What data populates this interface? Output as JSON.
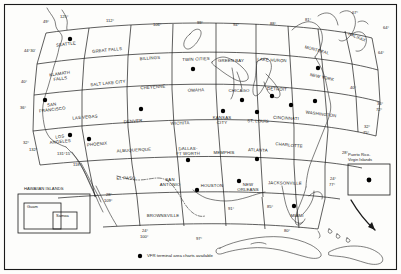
{
  "chart": {
    "type": "map",
    "border_color": "#1a1a1a",
    "line_color": "#1a1a1a",
    "dot_color": "#000000",
    "background": "#fdfdfb"
  },
  "legend": {
    "marker": "filled-circle",
    "text": "VFR terminal area charts available"
  },
  "insets": [
    {
      "name": "hawaiian-islands",
      "title": "HAWAIIAN ISLANDS",
      "sub_boxes": [
        {
          "label": "Guam"
        },
        {
          "label": "Samoa"
        }
      ]
    },
    {
      "name": "puerto-rico",
      "title": "Puerto Rico-\nVirgin Islands",
      "title_line1": "Puerto Rico-",
      "title_line2": "Virgin Islands",
      "has_dot": true
    }
  ],
  "charts": [
    {
      "label": "SEATTLE",
      "x": 66,
      "y": 44,
      "rot": -7,
      "dot": [
        70,
        39
      ]
    },
    {
      "label": "GREAT FALLS",
      "x": 107,
      "y": 50,
      "rot": -6,
      "dot": null
    },
    {
      "label": "BILLINGS",
      "x": 150,
      "y": 58,
      "rot": -4,
      "dot": null
    },
    {
      "label": "TWIN CITIES",
      "x": 196,
      "y": 59,
      "rot": -2,
      "dot": [
        193,
        69
      ]
    },
    {
      "label": "GREEN BAY",
      "x": 231,
      "y": 60,
      "rot": 0,
      "dot": null
    },
    {
      "label": "LAKE HURON",
      "x": 272,
      "y": 60,
      "rot": 3,
      "dot": null
    },
    {
      "label": "MONTREAL",
      "x": 317,
      "y": 50,
      "rot": 15,
      "dot": null
    },
    {
      "label": "HALIFAX",
      "x": 357,
      "y": 37,
      "rot": 22,
      "dot": null
    },
    {
      "label": "KLAMATH FALLS",
      "x": 60,
      "y": 76,
      "rot": -8,
      "dot": null
    },
    {
      "label": "SALT LAKE CITY",
      "x": 108,
      "y": 83,
      "rot": -6,
      "dot": null
    },
    {
      "label": "CHEYENNE",
      "x": 153,
      "y": 87,
      "rot": -4,
      "dot": null
    },
    {
      "label": "OMAHA",
      "x": 196,
      "y": 90,
      "rot": -2,
      "dot": null
    },
    {
      "label": "CHICAGO",
      "x": 239,
      "y": 90,
      "rot": 0,
      "dot": [
        242,
        100
      ]
    },
    {
      "label": "DETROIT",
      "x": 277,
      "y": 89,
      "rot": 3,
      "dot": [
        272,
        96
      ]
    },
    {
      "label": "NEW YORK",
      "x": 322,
      "y": 77,
      "rot": 12,
      "dot": [
        318,
        68
      ]
    },
    {
      "label": "SAN FRANCISCO",
      "x": 52,
      "y": 107,
      "rot": -7,
      "dot": [
        45,
        100
      ]
    },
    {
      "label": "LAS VEGAS",
      "x": 85,
      "y": 117,
      "rot": -5,
      "dot": null
    },
    {
      "label": "DENVER",
      "x": 133,
      "y": 121,
      "rot": -4,
      "dot": [
        141,
        109
      ]
    },
    {
      "label": "WICHITA",
      "x": 180,
      "y": 123,
      "rot": -2,
      "dot": null
    },
    {
      "label": "KANSAS CITY",
      "x": 222,
      "y": 120,
      "rot": 0,
      "dot": [
        223,
        111
      ]
    },
    {
      "label": "ST. LOUIS",
      "x": 258,
      "y": 121,
      "rot": 1,
      "dot": [
        257,
        112
      ]
    },
    {
      "label": "CINCINNATI",
      "x": 286,
      "y": 118,
      "rot": 3,
      "dot": [
        291,
        105
      ]
    },
    {
      "label": "WASHINGTON",
      "x": 321,
      "y": 114,
      "rot": 7,
      "dot": [
        315,
        101
      ]
    },
    {
      "label": "LOS ANGELES",
      "x": 60,
      "y": 139,
      "rot": -6,
      "dot": [
        70,
        135
      ]
    },
    {
      "label": "PHOENIX",
      "x": 97,
      "y": 144,
      "rot": -5,
      "dot": [
        89,
        139
      ]
    },
    {
      "label": "ALBUQUERQUE",
      "x": 134,
      "y": 150,
      "rot": -3,
      "dot": null
    },
    {
      "label": "DALLAS-FT WORTH",
      "x": 188,
      "y": 151,
      "rot": -1,
      "dot": [
        188,
        160
      ]
    },
    {
      "label": "MEMPHIS",
      "x": 224,
      "y": 152,
      "rot": 0,
      "dot": null
    },
    {
      "label": "ATLANTA",
      "x": 258,
      "y": 150,
      "rot": 2,
      "dot": [
        257,
        159
      ]
    },
    {
      "label": "CHARLOTTE",
      "x": 289,
      "y": 145,
      "rot": 6,
      "dot": null
    },
    {
      "label": "EL PASO",
      "x": 126,
      "y": 178,
      "rot": -1,
      "dot": null
    },
    {
      "label": "SAN ANTONIO",
      "x": 170,
      "y": 182,
      "rot": 0,
      "dot": null
    },
    {
      "label": "HOUSTON",
      "x": 212,
      "y": 185,
      "rot": 0,
      "dot": [
        197,
        190
      ]
    },
    {
      "label": "NEW ORLEANS",
      "x": 248,
      "y": 187,
      "rot": 0,
      "dot": [
        239,
        181
      ]
    },
    {
      "label": "JACKSONVILLE",
      "x": 285,
      "y": 183,
      "rot": 1,
      "dot": null
    },
    {
      "label": "BROWNSVILLE",
      "x": 163,
      "y": 215,
      "rot": 0,
      "dot": null
    },
    {
      "label": "MIAMI",
      "x": 297,
      "y": 215,
      "rot": 0,
      "dot": [
        294,
        206
      ]
    }
  ],
  "coordinates": [
    {
      "text": "49°",
      "x": 43,
      "y": 19
    },
    {
      "text": "125°",
      "x": 60,
      "y": 14
    },
    {
      "text": "112°",
      "x": 106,
      "y": 18
    },
    {
      "text": "106°",
      "x": 153,
      "y": 22
    },
    {
      "text": "99°",
      "x": 197,
      "y": 20
    },
    {
      "text": "94°",
      "x": 233,
      "y": 22
    },
    {
      "text": "88°",
      "x": 270,
      "y": 21
    },
    {
      "text": "81°",
      "x": 305,
      "y": 17
    },
    {
      "text": "67°",
      "x": 352,
      "y": 10
    },
    {
      "text": "64°",
      "x": 383,
      "y": 25
    },
    {
      "text": "64°",
      "x": 378,
      "y": 50
    },
    {
      "text": "44°30'",
      "x": 24,
      "y": 48
    },
    {
      "text": "40°",
      "x": 21,
      "y": 79
    },
    {
      "text": "36°",
      "x": 20,
      "y": 105
    },
    {
      "text": "32°",
      "x": 23,
      "y": 140
    },
    {
      "text": "132°",
      "x": 29,
      "y": 147
    },
    {
      "text": "131°15'",
      "x": 57,
      "y": 151
    },
    {
      "text": "118°",
      "x": 73,
      "y": 162
    },
    {
      "text": "28°",
      "x": 106,
      "y": 192
    },
    {
      "text": "109°",
      "x": 104,
      "y": 198
    },
    {
      "text": "24°",
      "x": 142,
      "y": 228
    },
    {
      "text": "100°",
      "x": 140,
      "y": 234
    },
    {
      "text": "97°",
      "x": 196,
      "y": 236
    },
    {
      "text": "91°",
      "x": 228,
      "y": 206
    },
    {
      "text": "85°",
      "x": 267,
      "y": 204
    },
    {
      "text": "28°",
      "x": 342,
      "y": 150
    },
    {
      "text": "24°",
      "x": 330,
      "y": 176
    },
    {
      "text": "77°",
      "x": 329,
      "y": 182
    },
    {
      "text": "80°",
      "x": 284,
      "y": 228
    },
    {
      "text": "32°",
      "x": 364,
      "y": 124
    },
    {
      "text": "75°",
      "x": 363,
      "y": 130
    },
    {
      "text": "36°",
      "x": 377,
      "y": 101
    },
    {
      "text": "72°",
      "x": 376,
      "y": 107
    },
    {
      "text": "40°",
      "x": 350,
      "y": 85
    }
  ]
}
